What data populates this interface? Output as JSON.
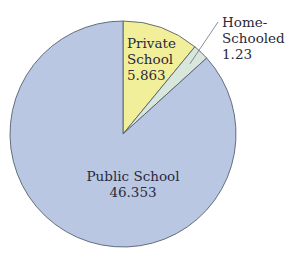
{
  "chart_data": {
    "type": "pie",
    "title": "",
    "slices": [
      {
        "label": "Private School",
        "value": 5.863,
        "color": "#f2ef9a"
      },
      {
        "label": "Home-Schooled",
        "value": 1.23,
        "color": "#d8e6dc"
      },
      {
        "label": "Public School",
        "value": 46.353,
        "color": "#b9c7e2"
      }
    ],
    "start_angle_deg": 0,
    "direction": "clockwise",
    "legend": "none (direct labels)"
  },
  "labels": {
    "private": {
      "line1": "Private",
      "line2": "School",
      "value": "5.863"
    },
    "home": {
      "line1": "Home-",
      "line2": "Schooled",
      "value": "1.23"
    },
    "public": {
      "line1": "Public School",
      "value": "46.353"
    }
  },
  "colors": {
    "outline": "#55606e",
    "text": "#2a2a3a"
  }
}
